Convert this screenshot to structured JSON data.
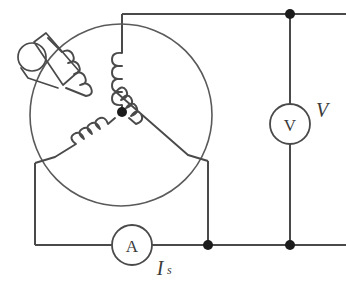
{
  "figure": {
    "background_color": "#ffffff",
    "wire_color": "#4a4a4a",
    "node_color": "#1c1c1c",
    "text_color": "#3b3b3b"
  },
  "machine": {
    "name": "three-phase-machine",
    "winding_connection": "wye",
    "phase_count": 3,
    "exciter": {
      "name": "field-winding-exciter",
      "description": "rotor field winding with slip ring"
    }
  },
  "meters": {
    "voltmeter": {
      "name": "voltmeter",
      "symbol": "V",
      "label": "V"
    },
    "ammeter": {
      "name": "ammeter",
      "symbol": "A",
      "label_main": "I",
      "label_sub": "s"
    }
  },
  "nodes": [
    {
      "name": "top-right-node",
      "x": 290,
      "y": 14
    },
    {
      "name": "bottom-middle-node",
      "x": 208,
      "y": 245
    },
    {
      "name": "bottom-right-node",
      "x": 290,
      "y": 245
    },
    {
      "name": "star-center-node",
      "x": 122,
      "y": 112
    }
  ]
}
